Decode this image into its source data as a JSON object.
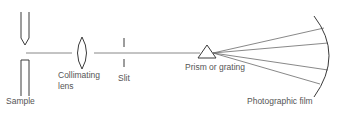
{
  "diagram": {
    "labels": {
      "sample": "Sample",
      "collimating_line1": "Collimating",
      "collimating_line2": "lens",
      "slit": "Slit",
      "prism": "Prism or grating",
      "film": "Photographic film"
    },
    "components": [
      "sample",
      "collimating-lens",
      "slit",
      "prism-or-grating",
      "photographic-film"
    ],
    "rays_count": 4,
    "colors": {
      "line": "#3a3a3a",
      "text": "#555555",
      "background": "#ffffff"
    }
  }
}
